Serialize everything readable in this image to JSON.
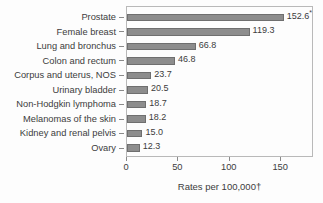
{
  "chart_data": {
    "type": "bar",
    "orientation": "horizontal",
    "title": "",
    "xlabel": "Rates per 100,000†",
    "ylabel": "",
    "xlim": [
      0,
      180
    ],
    "xticks": [
      0,
      50,
      100,
      150
    ],
    "xtick_labels": [
      "0",
      "50",
      "100",
      "150"
    ],
    "grid": false,
    "legend": false,
    "categories": [
      "Prostate",
      "Female breast",
      "Lung and bronchus",
      "Colon and rectum",
      "Corpus and uterus, NOS",
      "Urinary bladder",
      "Non-Hodgkin lymphoma",
      "Melanomas of the skin",
      "Kidney and renal pelvis",
      "Ovary"
    ],
    "values": [
      152.6,
      119.3,
      66.8,
      46.8,
      23.7,
      20.5,
      18.7,
      18.2,
      15.0,
      12.3
    ],
    "value_labels": [
      "152.6",
      "119.3",
      "66.8",
      "46.8",
      "23.7",
      "20.5",
      "18.7",
      "18.2",
      "15.0",
      "12.3"
    ],
    "value_label_marks": [
      "*",
      "",
      "",
      "",
      "",
      "",
      "",
      "",
      "",
      ""
    ],
    "bar_color": "#8d8d8d",
    "bar_edge_color": "#6f6f6f",
    "axis_color": "#b9b9b9",
    "text_color": "#3c3c3c",
    "background_color": "#fdfdfd"
  }
}
